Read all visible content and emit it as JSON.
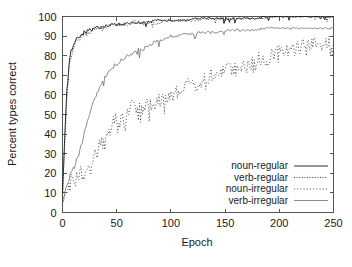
{
  "chart_data": {
    "type": "line",
    "title": "",
    "xlabel": "Epoch",
    "ylabel": "Percent types correct",
    "xlim": [
      0,
      250
    ],
    "ylim": [
      0,
      100
    ],
    "xticks": [
      0,
      50,
      100,
      150,
      200,
      250
    ],
    "yticks": [
      0,
      10,
      20,
      30,
      40,
      50,
      60,
      70,
      80,
      90,
      100
    ],
    "grid": false,
    "legend_position": "lower right",
    "x": [
      0,
      2,
      4,
      6,
      8,
      10,
      12,
      14,
      16,
      18,
      20,
      22,
      24,
      26,
      28,
      30,
      32,
      34,
      36,
      38,
      40,
      42,
      44,
      46,
      48,
      50,
      55,
      60,
      65,
      70,
      75,
      80,
      85,
      90,
      95,
      100,
      105,
      110,
      115,
      120,
      125,
      130,
      135,
      140,
      145,
      150,
      155,
      160,
      165,
      170,
      175,
      180,
      185,
      190,
      195,
      200,
      205,
      210,
      215,
      220,
      225,
      230,
      235,
      240,
      245,
      250
    ],
    "series": [
      {
        "name": "noun-regular",
        "style": "solid",
        "color": "#1a1a1a",
        "values": [
          10,
          38,
          62,
          76,
          82,
          86,
          88,
          90,
          90,
          91,
          92,
          92,
          93,
          93,
          93,
          94,
          94,
          94,
          95,
          95,
          95,
          95,
          96,
          96,
          96,
          96,
          96,
          97,
          97,
          97,
          97,
          97,
          98,
          98,
          98,
          98,
          98,
          98,
          98,
          99,
          99,
          99,
          99,
          99,
          99,
          99,
          99,
          99,
          99,
          99,
          99,
          99,
          100,
          100,
          100,
          100,
          100,
          100,
          100,
          100,
          100,
          100,
          100,
          100,
          100,
          100
        ]
      },
      {
        "name": "verb-regular",
        "style": "fine-dotted",
        "color": "#2a2a2a",
        "values": [
          8,
          34,
          58,
          74,
          80,
          84,
          87,
          88,
          89,
          90,
          91,
          91,
          92,
          92,
          93,
          93,
          94,
          94,
          94,
          95,
          95,
          95,
          95,
          96,
          96,
          96,
          96,
          96,
          97,
          97,
          97,
          97,
          97,
          97,
          98,
          98,
          98,
          98,
          98,
          98,
          98,
          99,
          99,
          99,
          99,
          99,
          99,
          99,
          99,
          99,
          99,
          99,
          99,
          99,
          100,
          100,
          100,
          100,
          100,
          100,
          100,
          100,
          100,
          100,
          100,
          100
        ]
      },
      {
        "name": "noun-irregular",
        "style": "dotted",
        "color": "#3a3a3a",
        "values": [
          4,
          8,
          11,
          14,
          16,
          17,
          19,
          20,
          20,
          19,
          21,
          23,
          25,
          26,
          27,
          29,
          31,
          33,
          35,
          37,
          39,
          41,
          43,
          45,
          47,
          47,
          49,
          51,
          58,
          52,
          54,
          56,
          55,
          58,
          57,
          59,
          62,
          61,
          64,
          66,
          65,
          68,
          69,
          70,
          71,
          72,
          74,
          73,
          75,
          76,
          77,
          78,
          79,
          80,
          81,
          82,
          83,
          83,
          84,
          85,
          86,
          86,
          85,
          86,
          87,
          86
        ]
      },
      {
        "name": "verb-irregular",
        "style": "light-solid",
        "color": "#707070",
        "values": [
          5,
          10,
          14,
          17,
          20,
          22,
          25,
          28,
          32,
          36,
          41,
          45,
          49,
          52,
          55,
          58,
          61,
          63,
          66,
          68,
          70,
          71,
          73,
          74,
          75,
          76,
          78,
          80,
          81,
          83,
          84,
          85,
          87,
          88,
          89,
          90,
          90,
          91,
          91,
          91,
          92,
          92,
          92,
          92,
          92,
          93,
          93,
          93,
          93,
          93,
          93,
          93,
          94,
          94,
          94,
          94,
          94,
          94,
          94,
          94,
          94,
          94,
          94,
          94,
          94,
          94
        ]
      }
    ]
  },
  "legend": {
    "entries": [
      {
        "label": "noun-regular"
      },
      {
        "label": "verb-regular"
      },
      {
        "label": "noun-irregular"
      },
      {
        "label": "verb-irregular"
      }
    ]
  }
}
